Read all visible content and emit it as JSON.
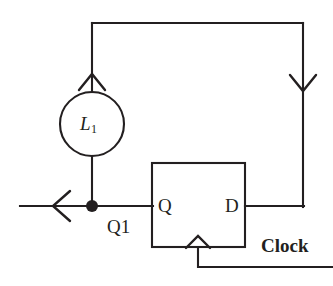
{
  "diagram": {
    "background_color": "#ffffff",
    "ink_color": "#231f20",
    "components": {
      "inductor": {
        "label_letter": "L",
        "label_subscript": "1",
        "shape": "circle",
        "center": [
          92,
          124
        ],
        "radius": 32
      },
      "flipflop": {
        "shape": "rectangle",
        "x": 152,
        "y": 163,
        "width": 93,
        "height": 84,
        "pins": {
          "output_left": "Q",
          "input_right": "D",
          "clock_trigger": "edge-triangle"
        }
      }
    },
    "labels": {
      "pin_q": "Q",
      "pin_d": "D",
      "node_q1": "Q1",
      "clock": "Clock"
    },
    "arrows": [
      {
        "name": "current-arrow-up-into-inductor",
        "direction": "up",
        "x": 92,
        "y": 78
      },
      {
        "name": "current-arrow-down-right-branch",
        "direction": "down",
        "x": 303,
        "y": 87
      },
      {
        "name": "current-arrow-left-output",
        "direction": "left",
        "x": 58,
        "y": 206
      }
    ],
    "junctions": [
      {
        "name": "node-q1-junction",
        "x": 92,
        "y": 206,
        "radius": 6
      }
    ],
    "wires": [
      {
        "name": "top-rail",
        "points": "92,23 303,23"
      },
      {
        "name": "left-vertical-to-inductor",
        "points": "92,23 92,92"
      },
      {
        "name": "inductor-to-node",
        "points": "92,156 92,206"
      },
      {
        "name": "right-vertical",
        "points": "303,23 303,206"
      },
      {
        "name": "d-input-wire",
        "points": "245,206 303,206"
      },
      {
        "name": "q-output-wire",
        "points": "20,206 152,206"
      },
      {
        "name": "clock-drop",
        "points": "198,247 198,267"
      },
      {
        "name": "clock-rail",
        "points": "198,267 333,267"
      }
    ]
  }
}
